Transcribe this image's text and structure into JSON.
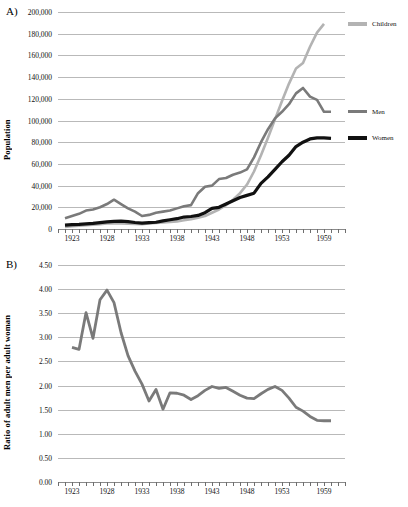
{
  "figure": {
    "panel_a_letter": "A)",
    "panel_b_letter": "B)"
  },
  "chart_data": [
    {
      "type": "line",
      "panel": "A)",
      "title": "",
      "xlabel": "",
      "ylabel": "Population",
      "xlim": [
        1921,
        1962
      ],
      "ylim": [
        0,
        200000
      ],
      "ytick_values": [
        0,
        20000,
        40000,
        60000,
        80000,
        100000,
        120000,
        140000,
        160000,
        180000,
        200000
      ],
      "ytick_labels": [
        "0",
        "20,000",
        "40,000",
        "60,000",
        "80,000",
        "100,000",
        "120,000",
        "140,000",
        "160,000",
        "180,000",
        "200,000"
      ],
      "xtick_labels": [
        "1923",
        "1928",
        "1933",
        "1938",
        "1943",
        "1948",
        "1953",
        "1959"
      ],
      "xtick_values": [
        1923,
        1928,
        1933,
        1938,
        1943,
        1948,
        1953,
        1959
      ],
      "grid": true,
      "legend_position": "right",
      "x": [
        1922,
        1923,
        1924,
        1925,
        1926,
        1927,
        1928,
        1929,
        1930,
        1931,
        1932,
        1933,
        1934,
        1935,
        1936,
        1937,
        1938,
        1939,
        1940,
        1941,
        1942,
        1943,
        1944,
        1945,
        1946,
        1947,
        1948,
        1949,
        1950,
        1951,
        1952,
        1953,
        1954,
        1955,
        1956,
        1957,
        1958,
        1959,
        1960
      ],
      "series": [
        {
          "name": "Children",
          "color": "#b3b3b3",
          "values": [
            2000,
            2500,
            3000,
            3500,
            4000,
            4500,
            5000,
            5200,
            5000,
            4800,
            4600,
            4500,
            5000,
            5500,
            6000,
            6500,
            7000,
            8000,
            9000,
            10500,
            12000,
            15000,
            18000,
            22000,
            27000,
            33000,
            41000,
            53000,
            68000,
            84000,
            101000,
            118000,
            134000,
            148000,
            153000,
            168000,
            181000,
            189000,
            null
          ]
        },
        {
          "name": "Men",
          "color": "#7a7a7a",
          "values": [
            10000,
            12000,
            14000,
            17000,
            18000,
            20000,
            23000,
            27000,
            23000,
            19000,
            16000,
            12000,
            13000,
            15000,
            16000,
            17000,
            19000,
            21000,
            22000,
            33000,
            39000,
            40000,
            46000,
            47000,
            50000,
            52000,
            55000,
            66000,
            80000,
            92000,
            102000,
            108000,
            115000,
            125000,
            130000,
            122000,
            119000,
            108000,
            108000
          ]
        },
        {
          "name": "Women",
          "color": "#111111",
          "values": [
            3500,
            4000,
            4300,
            4800,
            5200,
            5800,
            6500,
            7000,
            7200,
            6800,
            6000,
            5500,
            5800,
            6200,
            7500,
            8500,
            9500,
            11000,
            11500,
            12500,
            15000,
            19000,
            20000,
            23000,
            26000,
            29000,
            31000,
            33000,
            42000,
            48000,
            55000,
            62000,
            68000,
            76000,
            80000,
            83000,
            84000,
            84000,
            83500
          ]
        }
      ]
    },
    {
      "type": "line",
      "panel": "B)",
      "title": "",
      "xlabel": "",
      "ylabel": "Ratio of adult men per adult woman",
      "xlim": [
        1921,
        1962
      ],
      "ylim": [
        0,
        4.5
      ],
      "ytick_values": [
        0,
        0.5,
        1.0,
        1.5,
        2.0,
        2.5,
        3.0,
        3.5,
        4.0,
        4.5
      ],
      "ytick_labels": [
        "0.00",
        "0.50",
        "1.00",
        "1.50",
        "2.00",
        "2.50",
        "3.00",
        "3.50",
        "4.00",
        "4.50"
      ],
      "xtick_labels": [
        "1923",
        "1928",
        "1933",
        "1938",
        "1943",
        "1948",
        "1953",
        "1959"
      ],
      "xtick_values": [
        1923,
        1928,
        1933,
        1938,
        1943,
        1948,
        1953,
        1959
      ],
      "grid": true,
      "legend_position": "right",
      "x": [
        1923,
        1924,
        1925,
        1926,
        1927,
        1928,
        1929,
        1930,
        1931,
        1932,
        1933,
        1934,
        1935,
        1936,
        1937,
        1938,
        1939,
        1940,
        1941,
        1942,
        1943,
        1944,
        1945,
        1946,
        1947,
        1948,
        1949,
        1950,
        1951,
        1952,
        1953,
        1954,
        1955,
        1956,
        1957,
        1958,
        1959,
        1960
      ],
      "series": [
        {
          "name": "Men/Women",
          "color": "#7a7a7a",
          "values": [
            2.79,
            2.75,
            3.51,
            2.98,
            3.78,
            3.98,
            3.72,
            3.1,
            2.62,
            2.3,
            2.03,
            1.68,
            1.92,
            1.51,
            1.85,
            1.84,
            1.8,
            1.71,
            1.79,
            1.9,
            1.98,
            1.94,
            1.96,
            1.88,
            1.8,
            1.74,
            1.73,
            1.83,
            1.92,
            1.98,
            1.9,
            1.74,
            1.55,
            1.47,
            1.36,
            1.28,
            1.27,
            1.27
          ]
        }
      ]
    }
  ]
}
